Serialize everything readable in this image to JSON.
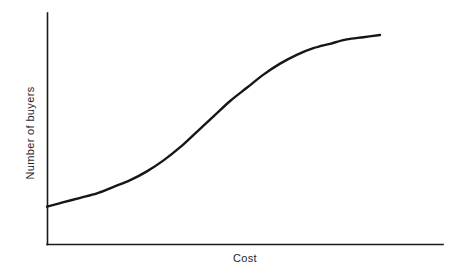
{
  "chart_data": {
    "type": "line",
    "title": "",
    "subtitle": "",
    "xlabel": "Cost",
    "ylabel": "Number of buyers",
    "grid": false,
    "legend": false,
    "legend_position": "none",
    "xlim": [
      0,
      100
    ],
    "ylim": [
      0,
      100
    ],
    "xticks": [],
    "yticks": [],
    "xtick_labels": [],
    "ytick_labels": [],
    "annotations": [],
    "series": [
      {
        "name": "Number of buyers",
        "shape": "sigmoid",
        "color": "#161616",
        "x": [
          0,
          5,
          10,
          15,
          20,
          25,
          30,
          35,
          40,
          45,
          50,
          55,
          60,
          65,
          70,
          75,
          80,
          85,
          90,
          95,
          100
        ],
        "y": [
          17,
          19,
          21,
          23,
          26,
          29,
          33,
          38,
          44,
          51,
          58,
          65,
          71,
          77,
          82,
          86,
          89,
          91,
          93,
          94,
          95
        ]
      }
    ]
  },
  "axes": {
    "y_axis_name": "y-axis",
    "x_axis_name": "x-axis",
    "line_color": "#1a1a1a"
  },
  "colors": {
    "background": "#ffffff",
    "curve": "#161616",
    "axis": "#1a1a1a",
    "text": "#1f1f1f"
  }
}
